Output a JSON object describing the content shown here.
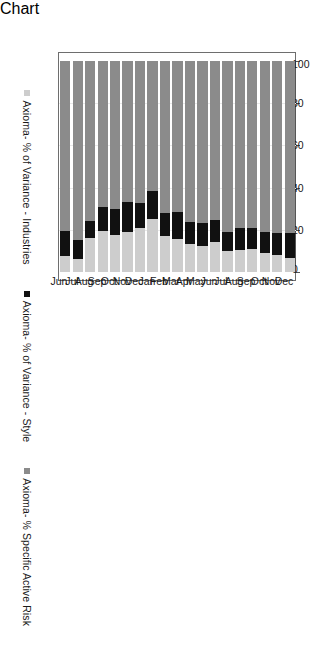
{
  "chart_data": {
    "type": "bar",
    "orientation": "horizontal-stacked",
    "title": "",
    "xlabel": "",
    "ylabel": "",
    "xlim": [
      100,
      0
    ],
    "axis_direction": "reversed",
    "grid": true,
    "stacked": true,
    "stack_total": 100,
    "legend_position": "left",
    "tick_labels": [
      "100",
      "80",
      "60",
      "40",
      "20",
      "0"
    ],
    "tick_values": [
      100,
      80,
      60,
      40,
      20,
      0
    ],
    "categories": [
      "Dec",
      "Nov",
      "Oct",
      "Sep",
      "Aug",
      "Jul",
      "Jun",
      "May",
      "Apr",
      "Mar",
      "Feb",
      "Jan",
      "Dec",
      "Nov",
      "Oct",
      "Sep",
      "Aug",
      "Jul",
      "Jun"
    ],
    "series": [
      {
        "name": "Axioma- % of Variance - Industries",
        "color": "#cdcdcd",
        "values": [
          6.5,
          8.0,
          9.0,
          11.0,
          10.5,
          10.0,
          14.0,
          12.5,
          13.5,
          15.5,
          17.0,
          25.0,
          21.0,
          19.0,
          17.5,
          19.5,
          16.0,
          6.0,
          7.5
        ]
      },
      {
        "name": "Axioma- % of Variance - Style",
        "color": "#111111",
        "values": [
          12.0,
          10.5,
          10.0,
          10.0,
          10.5,
          9.0,
          10.5,
          10.5,
          10.0,
          13.0,
          11.0,
          13.5,
          11.5,
          14.0,
          12.5,
          11.5,
          8.0,
          9.0,
          12.0
        ]
      },
      {
        "name": "Axioma- % Specific Active Risk",
        "color": "#8b8b8b",
        "values": [
          81.5,
          81.5,
          81.0,
          79.0,
          79.0,
          81.0,
          75.5,
          77.0,
          76.5,
          71.5,
          72.0,
          61.5,
          67.5,
          67.0,
          70.0,
          69.0,
          76.0,
          85.0,
          80.5
        ]
      }
    ]
  },
  "legend": {
    "items": [
      {
        "label": "Axioma- % Specific Active Risk",
        "color": "#8b8b8b",
        "swatch": "risk"
      },
      {
        "label": "Axioma- % of Variance - Style",
        "color": "#111111",
        "swatch": "style"
      },
      {
        "label": "Axioma- % of Variance - Industries",
        "color": "#cdcdcd",
        "swatch": "ind"
      }
    ]
  },
  "caption": {
    "text": ""
  }
}
